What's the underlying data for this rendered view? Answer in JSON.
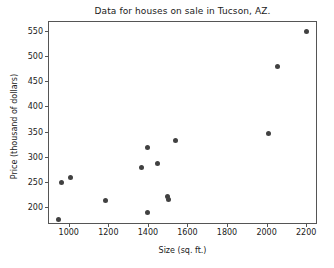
{
  "chart_data": {
    "type": "scatter",
    "title": "Data for houses on sale in Tucson, AZ.",
    "xlabel": "Size (sq. ft.)",
    "ylabel": "Price (thousand of dollars)",
    "xlim": [
      900,
      2260
    ],
    "ylim": [
      165,
      567
    ],
    "grid": false,
    "legend": null,
    "marker_color": "#414141",
    "xticks": [
      1000,
      1200,
      1400,
      1600,
      1800,
      2000,
      2200
    ],
    "xtick_labels": [
      "1000",
      "1200",
      "1400",
      "1600",
      "1800",
      "2000",
      "2200"
    ],
    "yticks": [
      200,
      250,
      300,
      350,
      400,
      450,
      500,
      550
    ],
    "ytick_labels": [
      "200",
      "250",
      "300",
      "350",
      "400",
      "450",
      "500",
      "550"
    ],
    "series": [
      {
        "name": "houses",
        "points": [
          {
            "x": 950,
            "y": 176
          },
          {
            "x": 965,
            "y": 250
          },
          {
            "x": 1010,
            "y": 259
          },
          {
            "x": 1185,
            "y": 214
          },
          {
            "x": 1370,
            "y": 278
          },
          {
            "x": 1400,
            "y": 318
          },
          {
            "x": 1400,
            "y": 189
          },
          {
            "x": 1450,
            "y": 287
          },
          {
            "x": 1500,
            "y": 221
          },
          {
            "x": 1505,
            "y": 216
          },
          {
            "x": 1540,
            "y": 333
          },
          {
            "x": 2010,
            "y": 346
          },
          {
            "x": 2055,
            "y": 478
          },
          {
            "x": 2200,
            "y": 548
          }
        ]
      }
    ]
  }
}
